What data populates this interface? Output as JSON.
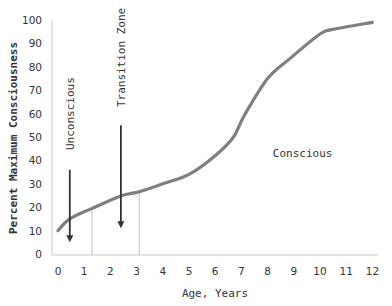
{
  "chart_data": {
    "type": "line",
    "title": "",
    "xlabel": "Age, Years",
    "ylabel": "Percent Maximum Consciousness",
    "xlim": [
      0,
      12
    ],
    "ylim": [
      0,
      100
    ],
    "x_ticks": [
      0,
      1,
      2,
      3,
      4,
      5,
      6,
      7,
      8,
      9,
      10,
      11,
      12
    ],
    "y_ticks": [
      0,
      10,
      20,
      30,
      40,
      50,
      60,
      70,
      80,
      90,
      100
    ],
    "grid": false,
    "legend": null,
    "series": [
      {
        "name": "Consciousness",
        "color": "#7f7f7f",
        "x": [
          0,
          0.45,
          1.3,
          2.4,
          3.1,
          4.0,
          5.0,
          6.0,
          6.7,
          7.1,
          8.0,
          8.85,
          10.0,
          10.5,
          12.0
        ],
        "y": [
          10,
          15,
          19.5,
          24.8,
          26.6,
          30,
          34,
          42,
          50,
          59,
          75,
          83.5,
          94,
          96,
          99
        ]
      }
    ],
    "zone_boundaries": [
      1.3,
      3.1
    ],
    "annotations": [
      {
        "text": "Unconscious",
        "x": 0.45,
        "y_text_center": 60,
        "rotated": true,
        "arrow": {
          "from_y": 36,
          "to_y": 5
        }
      },
      {
        "text": "Transition Zone",
        "x": 2.4,
        "y_text_center": 84,
        "rotated": true,
        "arrow": {
          "from_y": 55,
          "to_y": 11
        }
      },
      {
        "text": "Conscious",
        "x": 8.2,
        "y": 43,
        "rotated": false
      }
    ]
  },
  "colors": {
    "line": "#7f7f7f",
    "axis": "#c8c8c8",
    "zone_line": "#bdbdbd",
    "arrow": "#333333",
    "text": "#333333"
  }
}
